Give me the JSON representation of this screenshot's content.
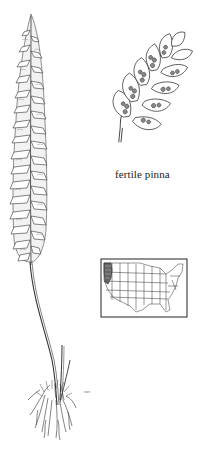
{
  "illustration": {
    "subject": "fern frond with roots",
    "detail_caption": "fertile pinna",
    "artist_signature": "swr",
    "range_map": {
      "region": "United States",
      "highlighted_area": "Pacific Northwest (Oregon/Washington/N. California)"
    },
    "colors": {
      "ink": "#222222",
      "background": "#ffffff",
      "map_highlight": "#666666"
    }
  }
}
